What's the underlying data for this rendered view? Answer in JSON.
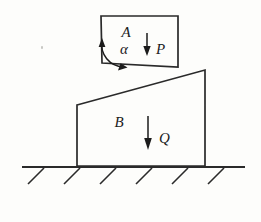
{
  "figure": {
    "background_color": "#fdfdfb",
    "line_color": "#2a2a2a",
    "labels": {
      "block_a": "A",
      "angle_alpha": "α",
      "force_p": "P",
      "block_b": "B",
      "force_q": "Q"
    },
    "blocks": {
      "a": {
        "name": "A",
        "shape": "quadrilateral",
        "points": "101,16 178,16 178,67 102,63",
        "label_position": {
          "x": 126,
          "y": 37
        },
        "angle_label_position": {
          "x": 124,
          "y": 54
        }
      },
      "b": {
        "name": "B",
        "shape": "trapezoid",
        "points": "77,105 205,70 205,166 77,166",
        "label_position": {
          "x": 119,
          "y": 127
        }
      }
    },
    "forces": [
      {
        "name": "P",
        "direction": "down",
        "shaft": {
          "x": 147,
          "y1": 33,
          "y2": 50
        },
        "head": "147,56 143.3,46 150.7,46",
        "label_position": {
          "x": 156,
          "y": 54
        }
      },
      {
        "name": "Q",
        "direction": "down",
        "shaft": {
          "x": 148,
          "y1": 116,
          "y2": 142
        },
        "head": "148,150 144.2,138 151.8,138",
        "label_position": {
          "x": 159,
          "y": 143
        }
      }
    ],
    "angle_arc": {
      "name": "alpha",
      "vertex": {
        "x": 102,
        "y": 63
      },
      "path": "M 102 41 A 22 22 0 0 0 123.2 66.7",
      "arrow_head_up": "102,38 98.6,47 105.4,47",
      "arrow_head_end": "127.5,67.4 118.0,70.5 120.6,63.2"
    },
    "ground": {
      "line": {
        "x1": 22,
        "y1": 167,
        "x2": 245,
        "y2": 167
      },
      "hatch_count": 6,
      "hatches": [
        {
          "x1": 28,
          "y1": 184,
          "x2": 44,
          "y2": 168
        },
        {
          "x1": 64,
          "y1": 184,
          "x2": 80,
          "y2": 168
        },
        {
          "x1": 100,
          "y1": 184,
          "x2": 116,
          "y2": 168
        },
        {
          "x1": 136,
          "y1": 184,
          "x2": 152,
          "y2": 168
        },
        {
          "x1": 172,
          "y1": 184,
          "x2": 188,
          "y2": 168
        },
        {
          "x1": 208,
          "y1": 184,
          "x2": 224,
          "y2": 168
        }
      ]
    },
    "speck": {
      "x": 41,
      "y": 46
    }
  }
}
